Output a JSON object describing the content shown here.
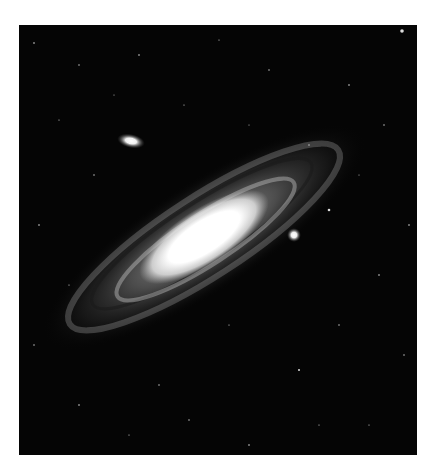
{
  "image": {
    "subject": "spiral galaxy",
    "alt": "Grayscale photograph of a large spiral galaxy seen at an oblique angle with two small satellite galaxies against a star field",
    "colors": {
      "background": "#ffffff",
      "sky": "#050505",
      "core": "#ffffff",
      "halo": "#8a8a8a"
    }
  }
}
